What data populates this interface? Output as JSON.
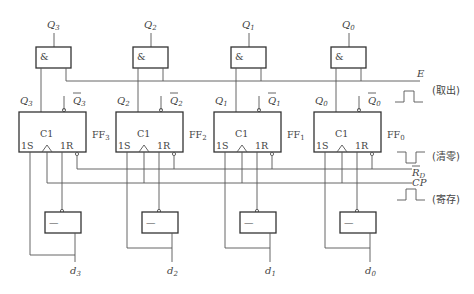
{
  "diagram": {
    "type": "4-bit parallel register circuit",
    "signals": {
      "enable": "E",
      "enable_note": "(取出)",
      "reset": "R",
      "reset_sub": "D",
      "reset_note": "(清零)",
      "clock": "CP",
      "clock_note": "(寄存)"
    },
    "gate_symbols": {
      "and": "&",
      "not": "—"
    },
    "pin_labels": {
      "set": "1S",
      "clock": "C1",
      "reset": "1R"
    },
    "flipflops": [
      {
        "name": "FF",
        "sub": "3",
        "q": "Q",
        "q_sub": "3",
        "out": "Q",
        "out_sub": "3",
        "d": "d",
        "d_sub": "3"
      },
      {
        "name": "FF",
        "sub": "2",
        "q": "Q",
        "q_sub": "2",
        "out": "Q",
        "out_sub": "2",
        "d": "d",
        "d_sub": "2"
      },
      {
        "name": "FF",
        "sub": "1",
        "q": "Q",
        "q_sub": "1",
        "out": "Q",
        "out_sub": "1",
        "d": "d",
        "d_sub": "1"
      },
      {
        "name": "FF",
        "sub": "0",
        "q": "Q",
        "q_sub": "0",
        "out": "Q",
        "out_sub": "0",
        "d": "d",
        "d_sub": "0"
      }
    ]
  }
}
